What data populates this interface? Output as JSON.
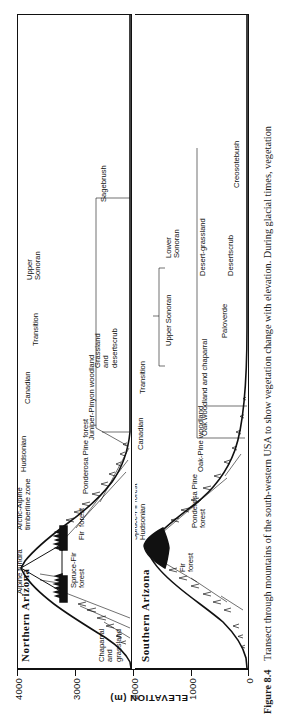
{
  "figure": {
    "number": "Figure 8.4",
    "caption": "Transect through mountains of the south-western USA to show vegetation change with elevation. During glacial times, vegetation"
  },
  "axis": {
    "title": "ELEVATION (m)",
    "unit": "m",
    "ticks": [
      "4000",
      "3000",
      "2000",
      "1000",
      "0"
    ],
    "tick_values": [
      4000,
      3000,
      2000,
      1000,
      0
    ],
    "min": 0,
    "max": 4000
  },
  "panels": [
    {
      "id": "northern-arizona",
      "title": "Northern Arizona",
      "zones": [
        "Hudsonian",
        "Canadian",
        "Transition",
        "Upper Sonoran"
      ],
      "vegetation": [
        "Alpine tundra",
        "Arctic-Alpine timberline zone",
        "Spruce-Fir forest",
        "Fir forest",
        "Ponderosa Pine forest",
        "Juniper-Pinyon woodland",
        "Chaparral and grassland",
        "Grassland and desertscrub",
        "Sagebrush"
      ],
      "labels": {
        "alpine_tundra": "Alpine tundra",
        "arctic_alpine": "Arctic-Alpine\ntimberline zone",
        "hudsonian": "Hudsonian",
        "spruce_fir": "Spruce-Fir\nforest",
        "fir_forest": "Fir  forest",
        "canadian": "Canadian",
        "ponderosa": "Ponderosa Pine forest",
        "juniper_pinyon": "Juniper-Pinyon woodland",
        "transition": "Transition",
        "upper_sonoran": "Upper\nSonoran",
        "chaparral_grassland": "Chaparral\nand\ngrassland",
        "grassland_desertscrub": "Grassland\nand\ndesertscrub",
        "sagebrush": "Sagebrush"
      }
    },
    {
      "id": "southern-arizona",
      "title": "Southern  Arizona",
      "zones": [
        "Hudsonian",
        "Canadian",
        "Transition",
        "Upper Sonoran",
        "Lower Sonoran"
      ],
      "vegetation": [
        "Spruce-Fir forest",
        "Fir forest",
        "Ponderosa Pine forest",
        "Oak-Pine woodland",
        "Oak woodland and chaparral",
        "Desert-grassland",
        "Paloverde",
        "Desertscrub",
        "Creosotebush"
      ],
      "labels": {
        "spruce_fir_hudsonian": "Spruce-Fir forest\nHudsonian",
        "fir_forest": "Fir\nforest",
        "canadian": "Canadian",
        "ponderosa": "Ponderosa Pine\nforest",
        "transition": "Transition",
        "oak_pine": "Oak-Pine woodland",
        "oak_chaparral": "Oak woodland and chaparral",
        "upper_sonoran": "Upper Sonoran",
        "lower_sonoran": "Lower\nSonoran",
        "desert_grassland": "Desert-grassland",
        "paloverde": "Paloverde",
        "desertscrub": "Desertscrub",
        "creosotebush": "Creosotebush"
      }
    }
  ],
  "colors": {
    "ink": "#111111",
    "paper": "#ffffff"
  }
}
